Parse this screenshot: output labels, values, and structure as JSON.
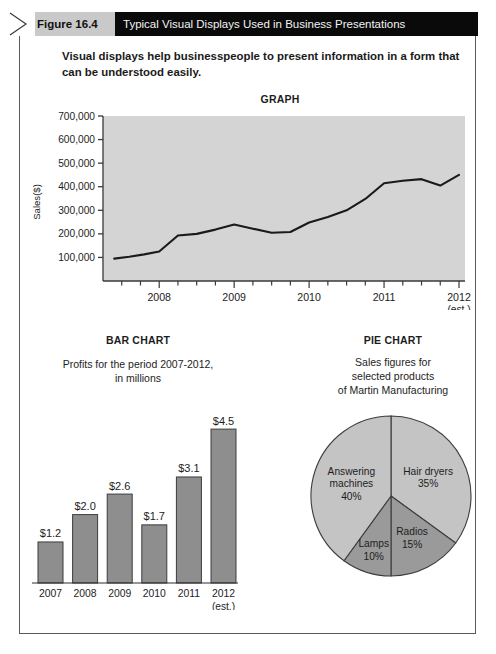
{
  "header": {
    "figure_number": "Figure 16.4",
    "figure_title": "Typical Visual Displays Used in Business Presentations",
    "arrow_icon": "chevron-right-icon"
  },
  "caption": "Visual displays help businesspeople to present information in a form that can be understood easily.",
  "colors": {
    "header_bar": "#0a0a0a",
    "header_tab": "#c9c9c9",
    "plot_background": "#d4d4d4",
    "line_color": "#1a1a1a",
    "bar_fill": "#8e8e8e",
    "pie_light": "#c4c4c4",
    "pie_dark": "#9a9a9a",
    "border": "#5a5a5a"
  },
  "chart_data": [
    {
      "type": "line",
      "title": "GRAPH",
      "xlabel": "",
      "ylabel": "Sales($)",
      "ylim": [
        0,
        700000
      ],
      "yticks": [
        100000,
        200000,
        300000,
        400000,
        500000,
        600000,
        700000
      ],
      "ytick_labels": [
        "100,000",
        "200,000",
        "300,000",
        "400,000",
        "500,000",
        "600,000",
        "700,000"
      ],
      "xtick_labels": [
        "2008",
        "2009",
        "2010",
        "2011",
        "2012"
      ],
      "xtick_sublabel": "(est.)",
      "grid": false,
      "legend_position": "none",
      "x": [
        2007.4,
        2007.6,
        2007.8,
        2008.0,
        2008.25,
        2008.5,
        2008.75,
        2009.0,
        2009.25,
        2009.5,
        2009.75,
        2010.0,
        2010.25,
        2010.5,
        2010.75,
        2011.0,
        2011.25,
        2011.5,
        2011.75,
        2012.0
      ],
      "values": [
        95000,
        103000,
        113000,
        125000,
        193000,
        200000,
        218000,
        240000,
        222000,
        205000,
        208000,
        248000,
        272000,
        300000,
        348000,
        415000,
        425000,
        432000,
        405000,
        450000
      ],
      "peak_value": 450000,
      "start_value": 95000
    },
    {
      "type": "bar",
      "title": "BAR CHART",
      "subtitle": "Profits for the period 2007-2012,\nin millions",
      "subtitle_line1": "Profits for the period 2007-2012,",
      "subtitle_line2": "in millions",
      "categories": [
        "2007",
        "2008",
        "2009",
        "2010",
        "2011",
        "2012"
      ],
      "category_sublabel": "(est.)",
      "values": [
        1.2,
        2.0,
        2.6,
        1.7,
        3.1,
        4.5
      ],
      "data_labels": [
        "$1.2",
        "$2.0",
        "$2.6",
        "$1.7",
        "$3.1",
        "$4.5"
      ],
      "ylim": [
        0,
        5.0
      ],
      "xlabel": "",
      "ylabel": "",
      "grid": false,
      "legend_position": "none"
    },
    {
      "type": "pie",
      "title": "PIE CHART",
      "subtitle_line1": "Sales figures for",
      "subtitle_line2": "selected products",
      "subtitle_line3": "of Martin Manufacturing",
      "labels": [
        "Hair dryers",
        "Radios",
        "Lamps",
        "Answering machines"
      ],
      "values": [
        35,
        15,
        10,
        40
      ],
      "data_labels": [
        "35%",
        "15%",
        "10%",
        "40%"
      ],
      "slice_label_lines": [
        [
          "Hair dryers",
          "35%"
        ],
        [
          "Radios",
          "15%"
        ],
        [
          "Lamps",
          "10%"
        ],
        [
          "Answering",
          "machines",
          "40%"
        ]
      ],
      "legend_position": "none"
    }
  ]
}
